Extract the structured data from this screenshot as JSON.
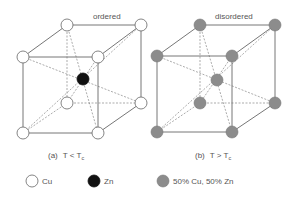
{
  "diagram": {
    "panels": [
      {
        "id": "a",
        "title": "ordered",
        "caption_prefix": "(a)",
        "caption_text": "T < T",
        "caption_sub": "c"
      },
      {
        "id": "b",
        "title": "disordered",
        "caption_prefix": "(b)",
        "caption_text": "T > T",
        "caption_sub": "c"
      }
    ],
    "legend": [
      {
        "label": "Cu",
        "fill": "#ffffff"
      },
      {
        "label": "Zn",
        "fill": "#111111"
      },
      {
        "label": "50% Cu, 50% Zn",
        "fill": "#8c8c8c"
      }
    ],
    "colors": {
      "cu": "#ffffff",
      "zn": "#111111",
      "mixed": "#8c8c8c",
      "edge": "#666666"
    }
  }
}
